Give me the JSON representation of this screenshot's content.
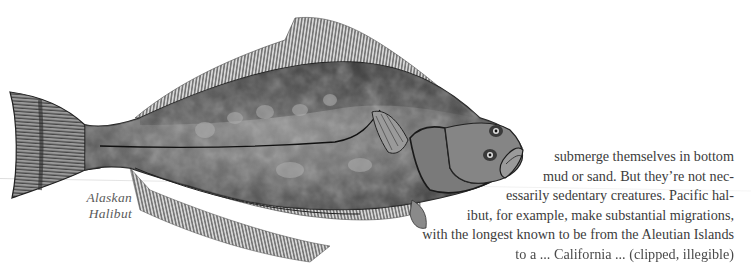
{
  "illustration": {
    "subject": "Alaskan Halibut",
    "caption_lines": [
      "Alaskan",
      "Halibut"
    ]
  },
  "body_text": {
    "lines": [
      "submerge themselves in bottom",
      "mud or sand.  But they’re not nec-",
      "essarily sedentary creatures.  Pacific hal-",
      "ibut, for example, make substantial migrations,",
      "with the longest known to be from the Aleutian Islands",
      "to a ... California ... (clipped, illegible)"
    ]
  },
  "colors": {
    "paper": "#ffffff",
    "text": "#3c3c3c",
    "caption": "#5a5a5a",
    "fish_dark": "#2a2a2a",
    "fish_mid": "#6e6e6e",
    "fish_light": "#a8a8a8"
  }
}
